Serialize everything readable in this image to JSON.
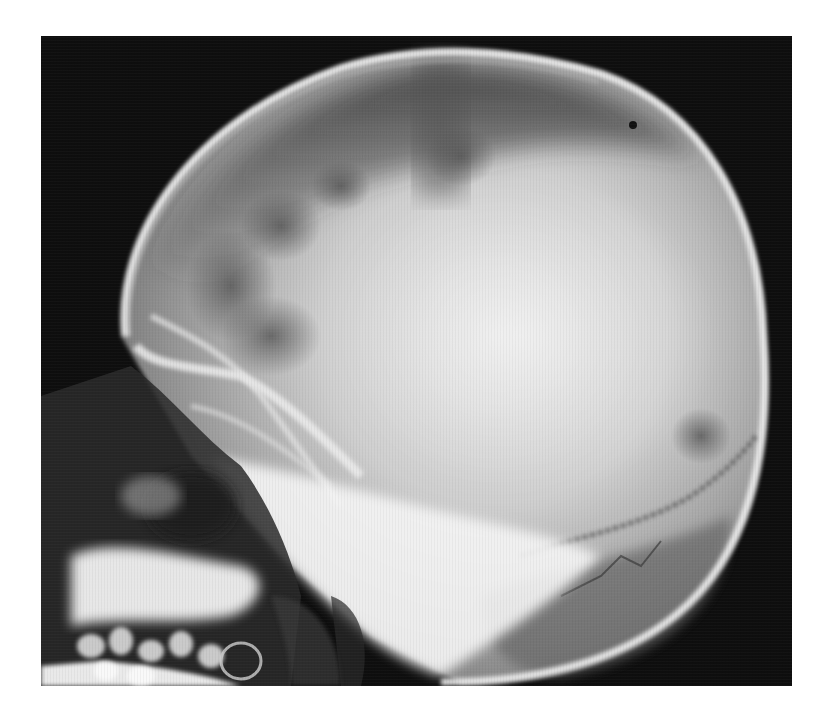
{
  "page": {
    "header_fragment": "",
    "background": "#ffffff"
  },
  "figure": {
    "type": "radiograph",
    "view": "lateral",
    "orientation": "face left, occiput right",
    "frame": {
      "x": 41,
      "y": 36,
      "width": 751,
      "height": 650
    },
    "colors": {
      "background": "#0e0e0e",
      "bone_highlight": "#f4f4f4",
      "soft_tissue": "#8a8a8a",
      "cranial_vault": "#c9c9c9"
    },
    "regions": [
      {
        "name": "calvarium",
        "label": ""
      },
      {
        "name": "frontal-bone",
        "label": ""
      },
      {
        "name": "orbit",
        "label": ""
      },
      {
        "name": "maxilla-teeth",
        "label": ""
      },
      {
        "name": "mandible",
        "label": ""
      },
      {
        "name": "skull-base",
        "label": ""
      },
      {
        "name": "occipital-bone",
        "label": ""
      },
      {
        "name": "lambdoid-suture",
        "label": ""
      }
    ]
  }
}
